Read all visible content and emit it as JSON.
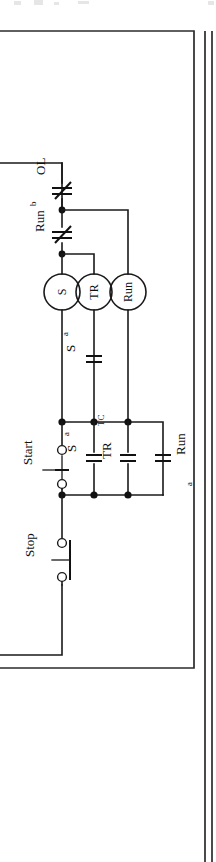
{
  "figure": {
    "kind": "electrical-ladder-diagram",
    "orientation": "rotated-90-ccw",
    "page_width": 216,
    "page_height": 862,
    "ink_color": "#1a1a1a",
    "background_color": "#ffffff",
    "border_color": "#2b2b2b"
  },
  "labels": {
    "ol": "OL",
    "run_b_main": "Run",
    "run_b_sub": "b",
    "coil_s": "S",
    "coil_tr": "TR",
    "coil_run": "Run",
    "s_a_upper_main": "S",
    "s_a_upper_sub": "a",
    "s_a_lower_main": "S",
    "s_a_lower_sub": "a",
    "tr_tc_main": "TR",
    "tr_tc_sub": "TC",
    "run_a_main": "Run",
    "run_a_sub": "a",
    "start": "Start",
    "stop": "Stop"
  },
  "components": [
    {
      "id": "ol-contact",
      "type": "normally-closed-contact",
      "label": "OL"
    },
    {
      "id": "runb-contact",
      "type": "normally-closed-contact",
      "label": "Run b"
    },
    {
      "id": "coil-s",
      "type": "relay-coil",
      "label": "S"
    },
    {
      "id": "coil-tr",
      "type": "relay-coil",
      "label": "TR"
    },
    {
      "id": "coil-run",
      "type": "relay-coil",
      "label": "Run"
    },
    {
      "id": "sa-contact-1",
      "type": "normally-open-contact",
      "label": "S a"
    },
    {
      "id": "sa-contact-2",
      "type": "normally-open-contact",
      "label": "S a"
    },
    {
      "id": "trtc-contact",
      "type": "timed-contact",
      "label": "TR TC"
    },
    {
      "id": "runa-contact",
      "type": "normally-open-contact",
      "label": "Run a"
    },
    {
      "id": "start-button",
      "type": "normally-open-pushbutton",
      "label": "Start"
    },
    {
      "id": "stop-button",
      "type": "normally-closed-pushbutton",
      "label": "Stop"
    }
  ],
  "nodes": [
    {
      "id": "n1",
      "x": 62,
      "y": 210
    },
    {
      "id": "n2",
      "x": 62,
      "y": 254
    },
    {
      "id": "n3",
      "x": 62,
      "y": 422
    },
    {
      "id": "n4",
      "x": 94,
      "y": 422
    },
    {
      "id": "n5",
      "x": 128,
      "y": 422
    },
    {
      "id": "n6",
      "x": 62,
      "y": 495
    },
    {
      "id": "n7",
      "x": 94,
      "y": 495
    },
    {
      "id": "n8",
      "x": 128,
      "y": 495
    }
  ]
}
